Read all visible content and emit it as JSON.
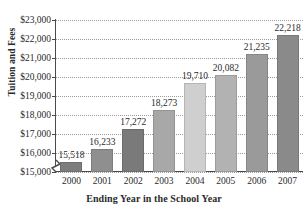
{
  "chart_data": {
    "type": "bar",
    "title": "",
    "subtitle": "",
    "xlabel": "Ending Year in the School Year",
    "ylabel": "Tuition and Fees",
    "categories": [
      "2000",
      "2001",
      "2002",
      "2003",
      "2004",
      "2005",
      "2006",
      "2007"
    ],
    "values": [
      15518,
      16233,
      17272,
      18273,
      19710,
      20082,
      21235,
      22218
    ],
    "value_labels": [
      "15,518",
      "16,233",
      "17,272",
      "18,273",
      "19,710",
      "20,082",
      "21,235",
      "22,218"
    ],
    "ylim": [
      15000,
      23000
    ],
    "ytick_values": [
      15000,
      16000,
      17000,
      18000,
      19000,
      20000,
      21000,
      22000,
      23000
    ],
    "ytick_labels": [
      "$15,000",
      "$16,000",
      "$17,000",
      "$18,000",
      "$19,000",
      "$20,000",
      "$21,000",
      "$22,000",
      "$23,000"
    ],
    "grid": "horizontal-dotted",
    "legend": "none",
    "axis_break": true,
    "bar_colors": [
      "#7d7d7d",
      "#8f8f8f",
      "#7a7a7a",
      "#a8a8a8",
      "#cfcfcf",
      "#b2b2b2",
      "#9a9a9a",
      "#8a8a8a"
    ],
    "gridline_color": "#9b9b9b",
    "axis_color": "#4a4a4a",
    "text_color": "#2b2b2b",
    "background": "#ffffff"
  },
  "axes": {
    "y_title": "Tuition and Fees",
    "x_title": "Ending Year in the School Year"
  }
}
